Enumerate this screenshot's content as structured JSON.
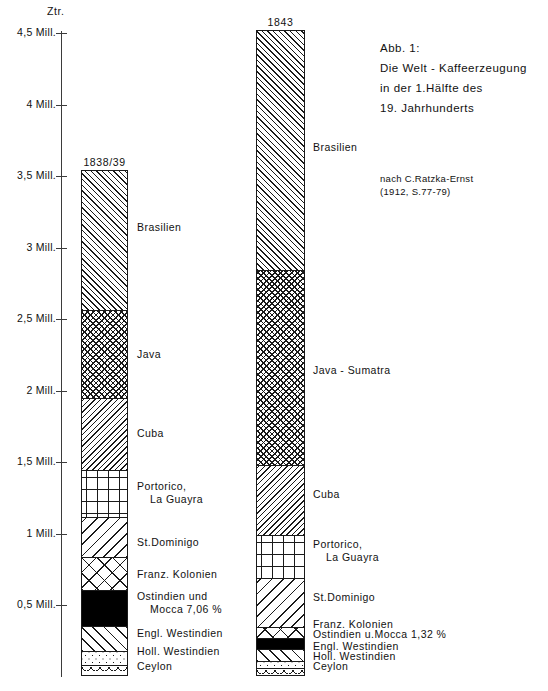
{
  "figure": {
    "title_lines": [
      "Abb. 1:",
      "Die Welt - Kaffeerzeugung",
      "in der 1.Hälfte  des",
      "19. Jahrhunderts"
    ],
    "source_lines": [
      "nach  C.Ratzka-Ernst",
      "(1912, S.77-79)"
    ]
  },
  "axis": {
    "unit_label": "Ztr.",
    "ticks": [
      {
        "label": "4,5 Mill.",
        "value": 4.5
      },
      {
        "label": "4 Mill.",
        "value": 4.0
      },
      {
        "label": "3,5 Mill.",
        "value": 3.5
      },
      {
        "label": "3 Mill.",
        "value": 3.0
      },
      {
        "label": "2,5 Mill.",
        "value": 2.5
      },
      {
        "label": "2 Mill.",
        "value": 2.0
      },
      {
        "label": "1,5 Mill.",
        "value": 1.5
      },
      {
        "label": "1 Mill.",
        "value": 1.0
      },
      {
        "label": "0,5 Mill.",
        "value": 0.5
      }
    ]
  },
  "chart_data": {
    "type": "bar",
    "title": "Die Welt - Kaffeerzeugung in der 1.Hälfte des 19. Jahrhunderts",
    "subtitle": "Abb. 1:",
    "source": "nach C.Ratzka-Ernst (1912, S.77-79)",
    "ylabel": "Ztr.",
    "xlabel": "",
    "ylim": [
      0,
      4.5
    ],
    "yunit": "Mill. Ztr.",
    "grid": false,
    "legend": "inline-labels",
    "stacked": true,
    "categories": [
      "1838/39",
      "1843"
    ],
    "series": [
      {
        "name": "Brasilien",
        "values": [
          0.98,
          1.69
        ]
      },
      {
        "name": "Java",
        "values": [
          0.61,
          null
        ]
      },
      {
        "name": "Java - Sumatra",
        "values": [
          null,
          1.36
        ]
      },
      {
        "name": "Cuba",
        "values": [
          0.5,
          0.51
        ]
      },
      {
        "name": "Portorico, La Guayra",
        "values": [
          0.33,
          0.31
        ]
      },
      {
        "name": "St.Dominigo",
        "values": [
          0.28,
          0.32
        ]
      },
      {
        "name": "Franz. Kolonien",
        "values": [
          0.23,
          0.08
        ]
      },
      {
        "name": "Ostindien und Mocca",
        "values": [
          0.25,
          0.06
        ]
      },
      {
        "name": "Engl. Westindien",
        "values": [
          0.17,
          0.08
        ]
      },
      {
        "name": "Holl. Westindien",
        "values": [
          0.1,
          0.06
        ]
      },
      {
        "name": "Ceylon",
        "values": [
          0.08,
          0.06
        ]
      }
    ],
    "totals": [
      3.54,
      4.51
    ],
    "annotations": [
      {
        "bar": "1838/39",
        "segment": "Ostindien und Mocca",
        "text": "7,06 %"
      },
      {
        "bar": "1843",
        "segment": "Ostindien u.Mocca",
        "text": "1,32 %"
      }
    ]
  },
  "bars": [
    {
      "id": "bar-1838",
      "header": "1838/39",
      "segments": [
        {
          "name": "Brasilien",
          "label_line1": "Brasilien",
          "label_line2": "",
          "pattern": "p-diag-r"
        },
        {
          "name": "Java",
          "label_line1": "Java",
          "label_line2": "",
          "pattern": "p-check"
        },
        {
          "name": "Cuba",
          "label_line1": "Cuba",
          "label_line2": "",
          "pattern": "p-diag-l"
        },
        {
          "name": "Portorico",
          "label_line1": "Portorico,",
          "label_line2": "La Guayra",
          "pattern": "p-plus"
        },
        {
          "name": "St.Dominigo",
          "label_line1": "St.Dominigo",
          "label_line2": "",
          "pattern": "p-diag-wide"
        },
        {
          "name": "Franz. Kolonien",
          "label_line1": "Franz. Kolonien",
          "label_line2": "",
          "pattern": "p-crossbig"
        },
        {
          "name": "Ostindien",
          "label_line1": "Ostindien und",
          "label_line2": "Mocca    7,06 %",
          "pattern": "p-solid"
        },
        {
          "name": "Engl. Westindien",
          "label_line1": "Engl. Westindien",
          "label_line2": "",
          "pattern": "p-diag-wide-r"
        },
        {
          "name": "Holl. Westindien",
          "label_line1": "Holl. Westindien",
          "label_line2": "",
          "pattern": "p-dots"
        },
        {
          "name": "Ceylon",
          "label_line1": "Ceylon",
          "label_line2": "",
          "pattern": "p-scallop"
        }
      ]
    },
    {
      "id": "bar-1843",
      "header": "1843",
      "segments": [
        {
          "name": "Brasilien",
          "label_line1": "Brasilien",
          "label_line2": "",
          "pattern": "p-diag-r"
        },
        {
          "name": "Java - Sumatra",
          "label_line1": "Java - Sumatra",
          "label_line2": "",
          "pattern": "p-check"
        },
        {
          "name": "Cuba",
          "label_line1": "Cuba",
          "label_line2": "",
          "pattern": "p-diag-l"
        },
        {
          "name": "Portorico",
          "label_line1": "Portorico,",
          "label_line2": "La Guayra",
          "pattern": "p-plus"
        },
        {
          "name": "St.Dominigo",
          "label_line1": "St.Dominigo",
          "label_line2": "",
          "pattern": "p-diag-wide"
        },
        {
          "name": "Franz. Kolonien",
          "label_line1": "Franz. Kolonien",
          "label_line2": "",
          "pattern": "p-crossbig"
        },
        {
          "name": "Ostindien",
          "label_line1": "Ostindien u.Mocca  1,32 %",
          "label_line2": "",
          "pattern": "p-solid"
        },
        {
          "name": "Engl. Westindien",
          "label_line1": "Engl. Westindien",
          "label_line2": "",
          "pattern": "p-diag-wide-r"
        },
        {
          "name": "Holl. Westindien",
          "label_line1": "Holl. Westindien",
          "label_line2": "",
          "pattern": "p-dots"
        },
        {
          "name": "Ceylon",
          "label_line1": "Ceylon",
          "label_line2": "",
          "pattern": "p-scallop"
        }
      ]
    }
  ]
}
